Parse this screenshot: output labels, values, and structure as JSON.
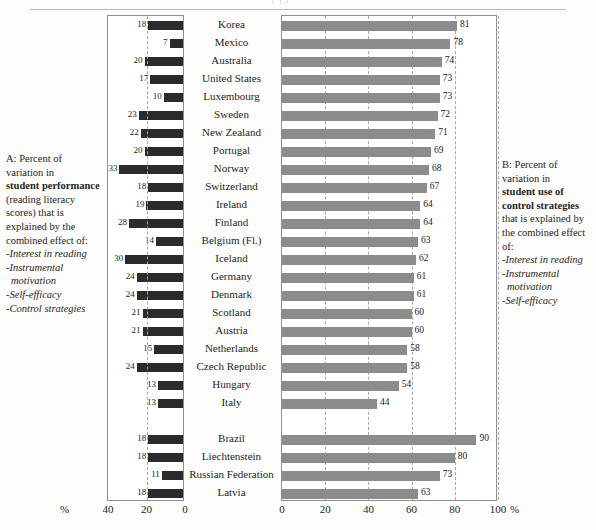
{
  "header": {
    "cropped_text": "( ) J"
  },
  "captions": {
    "left": {
      "lead": "A: Percent of",
      "line2": "variation in",
      "bold": "student performance",
      "tail": "(reading literacy scores) that is explained by the combined effect of:",
      "bullets": [
        "-Interest in reading",
        "-Instrumental",
        "motivation",
        "-Self-efficacy",
        "-Control strategies"
      ]
    },
    "right": {
      "lead": "B: Percent of",
      "line2": "variation in",
      "bold": "student use of control strategies",
      "tail": "that is explained by the combined effect of:",
      "bullets": [
        "-Interest in reading",
        "-Instrumental",
        "motivation",
        "-Self-efficacy"
      ]
    }
  },
  "axes": {
    "left": {
      "unit": "%",
      "ticks": [
        "40",
        "20",
        "0"
      ],
      "max": 40,
      "reversed": true
    },
    "right": {
      "unit": "%",
      "ticks": [
        "0",
        "20",
        "40",
        "60",
        "80",
        "100"
      ],
      "max": 100,
      "reversed": false
    }
  },
  "chart_data": {
    "type": "bar",
    "title": "",
    "xlabel": "%",
    "ylabel": "",
    "orientation": "horizontal",
    "categories": [
      "Korea",
      "Mexico",
      "Australia",
      "United States",
      "Luxembourg",
      "Sweden",
      "New Zealand",
      "Portugal",
      "Norway",
      "Switzerland",
      "Ireland",
      "Finland",
      "Belgium (Fl.)",
      "Iceland",
      "Germany",
      "Denmark",
      "Scotland",
      "Austria",
      "Netherlands",
      "Czech Republic",
      "Hungary",
      "Italy",
      "",
      "Brazil",
      "Liechtenstein",
      "Russian Federation",
      "Latvia"
    ],
    "series": [
      {
        "name": "A: Percent of variation in student performance",
        "direction": "left",
        "color": "#2b2b2b",
        "xlim": [
          0,
          40
        ],
        "values": [
          18,
          7,
          20,
          17,
          10,
          23,
          22,
          20,
          33,
          18,
          19,
          28,
          14,
          30,
          24,
          24,
          21,
          21,
          15,
          24,
          13,
          13,
          null,
          18,
          18,
          11,
          18
        ]
      },
      {
        "name": "B: Percent of variation in student use of control strategies",
        "direction": "right",
        "color": "#8c8c8c",
        "xlim": [
          0,
          100
        ],
        "values": [
          81,
          78,
          74,
          73,
          73,
          72,
          71,
          69,
          68,
          67,
          64,
          64,
          63,
          62,
          61,
          61,
          60,
          60,
          58,
          58,
          54,
          44,
          null,
          90,
          80,
          73,
          63
        ]
      }
    ],
    "grid": {
      "left_gridlines": [
        20
      ],
      "right_gridlines": [
        20,
        40,
        60,
        80,
        100
      ]
    },
    "legend": "none"
  }
}
